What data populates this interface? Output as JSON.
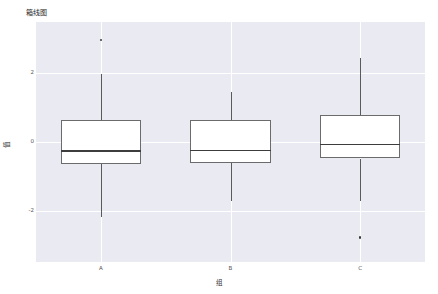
{
  "chart_data": {
    "type": "box",
    "title": "箱线图",
    "xlabel": "组",
    "ylabel": "值",
    "categories": [
      "A",
      "B",
      "C"
    ],
    "ylim": [
      -3.5,
      3.5
    ],
    "yticks": [
      2,
      0,
      -2
    ],
    "ytick_labels": [
      "2",
      "0",
      "-2"
    ],
    "xtick_labels": [
      "A",
      "B",
      "C"
    ],
    "grid": true,
    "legend": null,
    "background_color": "#eaeaf2",
    "grid_color": "#ffffff",
    "box_facecolor": "#ffffff",
    "box_edgecolor": "#6b6b6b",
    "median_color": "#3d3d3d",
    "whisker_color": "#5a5a5a",
    "outlier_color": "#3a3a3a",
    "boxes": [
      {
        "label": "A",
        "whisker_low": -2.18,
        "q1": -0.65,
        "median": -0.24,
        "q3": 0.65,
        "whisker_high": 1.98,
        "outliers": [
          2.97
        ]
      },
      {
        "label": "B",
        "whisker_low": -1.72,
        "q1": -0.62,
        "median": -0.22,
        "q3": 0.63,
        "whisker_high": 1.46,
        "outliers": []
      },
      {
        "label": "C",
        "whisker_low": -1.72,
        "q1": -0.48,
        "median": -0.05,
        "q3": 0.8,
        "whisker_high": 2.46,
        "outliers": [
          -2.78
        ]
      }
    ]
  },
  "axis": {
    "ytick_labels": [
      "2",
      "0",
      "-2"
    ],
    "xtick_labels": [
      "A",
      "B",
      "C"
    ]
  }
}
